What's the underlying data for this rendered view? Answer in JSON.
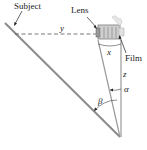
{
  "diagram": {
    "labels": {
      "subject": "Subject",
      "lens": "Lens",
      "film": "Film",
      "y": "y",
      "x": "x",
      "z": "z",
      "alpha": "α",
      "beta": "β"
    },
    "colors": {
      "line": "#9a9a9a",
      "subject_line": "#8c8c8c",
      "text": "#222222",
      "camera": "#7a7a7a"
    }
  }
}
